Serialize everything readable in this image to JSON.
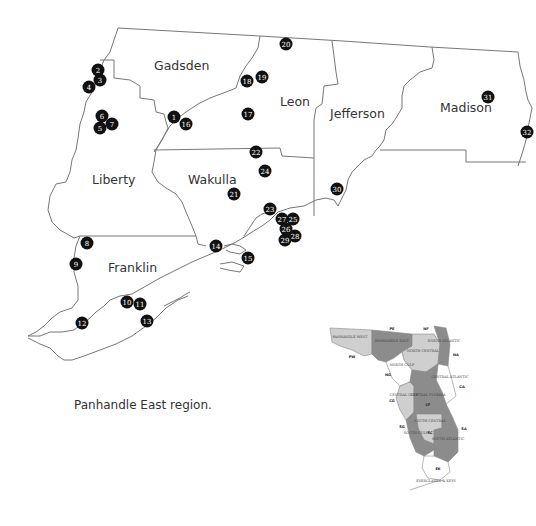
{
  "caption": "Panhandle East region.",
  "counties": [
    {
      "name": "Gadsden"
    },
    {
      "name": "Leon"
    },
    {
      "name": "Jefferson"
    },
    {
      "name": "Madison"
    },
    {
      "name": "Liberty"
    },
    {
      "name": "Wakulla"
    },
    {
      "name": "Franklin"
    }
  ],
  "sites": [
    "1",
    "2",
    "3",
    "4",
    "5",
    "6",
    "7",
    "8",
    "9",
    "10",
    "11",
    "12",
    "13",
    "14",
    "15",
    "16",
    "17",
    "18",
    "19",
    "20",
    "21",
    "22",
    "23",
    "24",
    "25",
    "26",
    "27",
    "28",
    "29",
    "30",
    "31",
    "32"
  ],
  "inset": {
    "regions": [
      {
        "name": "PANHANDLE WEST",
        "shade": "light"
      },
      {
        "name": "PANHANDLE EAST",
        "shade": "dark"
      },
      {
        "name": "NORTH CENTRAL",
        "shade": "light"
      },
      {
        "name": "NORTH ATLANTIC",
        "shade": "dark"
      },
      {
        "name": "NORTH GULF",
        "shade": "white"
      },
      {
        "name": "CENTRAL ATLANTIC",
        "shade": "white"
      },
      {
        "name": "CENTRAL GULF",
        "shade": "light"
      },
      {
        "name": "CENTRAL FLORIDA",
        "shade": "dark"
      },
      {
        "name": "SOUTH CENTRAL",
        "shade": "light"
      },
      {
        "name": "SOUTH GULF",
        "shade": "dark"
      },
      {
        "name": "SOUTH ATLANTIC",
        "shade": "dark"
      },
      {
        "name": "EVERGLADES & KEYS",
        "shade": "white"
      }
    ],
    "codes": [
      "PW",
      "PE",
      "NF",
      "NA",
      "NG",
      "CA",
      "CG",
      "CF",
      "SC",
      "SG",
      "SA",
      "EK"
    ]
  },
  "colors": {
    "marker": "#111111",
    "inset_dark": "#8c8c8c",
    "inset_light": "#cfcfcf",
    "inset_white": "#ffffff"
  }
}
